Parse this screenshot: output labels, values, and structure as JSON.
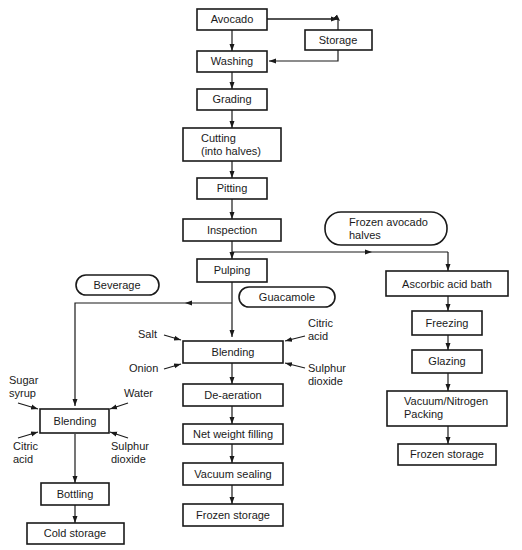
{
  "diagram": {
    "type": "process-flowchart",
    "main_line": {
      "avocado": "Avocado",
      "storage": "Storage",
      "washing": "Washing",
      "grading": "Grading",
      "cutting_1": "Cutting",
      "cutting_2": "(into halves)",
      "pitting": "Pitting",
      "inspection": "Inspection",
      "pulping": "Pulping"
    },
    "products": {
      "frozen_halves_1": "Frozen avocado",
      "frozen_halves_2": "halves",
      "beverage": "Beverage",
      "guacamole": "Guacamole"
    },
    "frozen_branch": {
      "ascorbic": "Ascorbic acid bath",
      "freezing": "Freezing",
      "glazing": "Glazing",
      "packing_1": "Vacuum/Nitrogen",
      "packing_2": "Packing",
      "frozen_storage": "Frozen storage"
    },
    "guacamole_branch": {
      "blending": "Blending",
      "inputs": {
        "salt": "Salt",
        "onion": "Onion",
        "citric_1": "Citric",
        "citric_2": "acid",
        "sulphur_1": "Sulphur",
        "sulphur_2": "dioxide"
      },
      "deaeration": "De-aeration",
      "filling": "Net weight filling",
      "sealing": "Vacuum sealing",
      "frozen_storage": "Frozen storage"
    },
    "beverage_branch": {
      "blending": "Blending",
      "inputs": {
        "sugar_1": "Sugar",
        "sugar_2": "syrup",
        "water": "Water",
        "citric_1": "Citric",
        "citric_2": "acid",
        "sulphur_1": "Sulphur",
        "sulphur_2": "dioxide"
      },
      "bottling": "Bottling",
      "cold_storage": "Cold storage"
    }
  }
}
